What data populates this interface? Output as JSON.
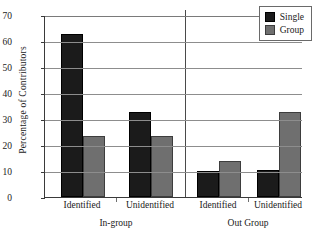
{
  "chart_data": {
    "type": "bar",
    "title": "",
    "xlabel": "",
    "ylabel": "Percentage of Contributors",
    "ylim": [
      0,
      70
    ],
    "ytick_labels": [
      "0",
      "10",
      "20",
      "30",
      "40",
      "50",
      "60",
      "70"
    ],
    "ytick_values": [
      0,
      10,
      20,
      30,
      40,
      50,
      60,
      70
    ],
    "grid": true,
    "legend_position": "top-right",
    "categories": [
      "Identified",
      "Unidentified",
      "Identified",
      "Unidentified"
    ],
    "supergroups": [
      {
        "label": "In-group",
        "categories": [
          "Identified",
          "Unidentified"
        ]
      },
      {
        "label": "Out Group",
        "categories": [
          "Identified",
          "Unidentified"
        ]
      }
    ],
    "series": [
      {
        "name": "Single",
        "color": "#1b1b1b",
        "values": [
          62.7,
          32.7,
          9.9,
          10.4
        ]
      },
      {
        "name": "Group",
        "color": "#6f6f6f",
        "values": [
          23.3,
          23.6,
          14.0,
          32.7
        ]
      }
    ]
  },
  "axis": {
    "y_title": "Percentage of Contributors"
  },
  "legend": {
    "entries": [
      {
        "label": "Single",
        "swatch": "single"
      },
      {
        "label": "Group",
        "swatch": "group"
      }
    ]
  },
  "xaxis": {
    "ticks": [
      {
        "label": "Identified"
      },
      {
        "label": "Unidentified"
      },
      {
        "label": "Identified"
      },
      {
        "label": "Unidentified"
      }
    ],
    "groups": [
      {
        "label": "In-group"
      },
      {
        "label": "Out Group"
      }
    ]
  }
}
